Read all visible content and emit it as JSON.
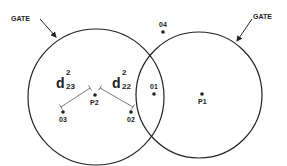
{
  "colors": {
    "line": "#222222",
    "background": "#ffffff"
  },
  "gates": [
    {
      "id": "left",
      "label": "GATE",
      "circle": {
        "cx": 96,
        "cy": 97,
        "r": 68
      },
      "label_pos": [
        11,
        15
      ],
      "arrow": [
        40,
        19,
        56,
        37
      ]
    },
    {
      "id": "right",
      "label": "GATE",
      "circle": {
        "cx": 199,
        "cy": 95,
        "r": 63
      },
      "label_pos": [
        253,
        13
      ],
      "arrow": [
        252,
        19,
        237,
        41
      ]
    }
  ],
  "points": [
    {
      "id": "P2",
      "label": "P2",
      "x": 95,
      "y": 95,
      "label_offset": [
        -5,
        4
      ]
    },
    {
      "id": "P1",
      "label": "P1",
      "x": 202,
      "y": 94,
      "label_offset": [
        -4,
        4
      ]
    },
    {
      "id": "01",
      "label": "01",
      "x": 154,
      "y": 94,
      "label_offset": [
        -4,
        -11
      ]
    },
    {
      "id": "02",
      "label": "02",
      "x": 131,
      "y": 112,
      "label_offset": [
        -4,
        4
      ]
    },
    {
      "id": "03",
      "label": "03",
      "x": 63,
      "y": 112,
      "label_offset": [
        -4,
        4
      ]
    },
    {
      "id": "04",
      "label": "04",
      "x": 163,
      "y": 32,
      "label_offset": [
        -4,
        -11
      ]
    }
  ],
  "distances": [
    {
      "id": "d23",
      "base": "d",
      "sup": "2",
      "sub": "23",
      "from": [
        90,
        88
      ],
      "to": [
        61,
        107
      ],
      "label_pos": [
        56,
        74
      ]
    },
    {
      "id": "d22",
      "base": "d",
      "sup": "2",
      "sub": "22",
      "from": [
        100,
        88
      ],
      "to": [
        133,
        107
      ],
      "label_pos": [
        112,
        74
      ]
    }
  ]
}
